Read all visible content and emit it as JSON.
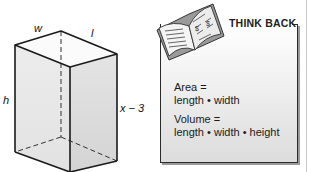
{
  "figure": {
    "labels": {
      "width": "w",
      "length": "l",
      "height": "h",
      "side_expression": "x − 3"
    }
  },
  "think_back": {
    "title": "THINK BACK",
    "icon": "open-book-icon",
    "area_label": "Area =",
    "area_formula": "length • width",
    "volume_label": "Volume =",
    "volume_formula": "length • width • height"
  },
  "colors": {
    "line": "#1a1a1a",
    "face_left": "#e6e6e6",
    "face_right": "#d8d8d8",
    "face_top": "#fafafa",
    "box_gradient_bottom": "#dcdcdc"
  }
}
